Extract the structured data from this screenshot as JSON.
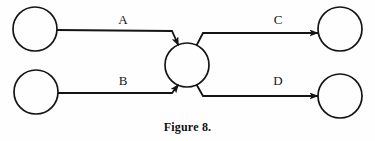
{
  "figure": {
    "caption": "Figure 8.",
    "background_color": "#fefefe",
    "stroke_color": "#141414"
  },
  "nodes": [
    {
      "id": "source-top",
      "name": "circle-node-source-top",
      "cx": 35,
      "cy": 29,
      "r": 22,
      "label": ""
    },
    {
      "id": "source-bottom",
      "name": "circle-node-source-bottom",
      "cx": 36,
      "cy": 92,
      "r": 22,
      "label": ""
    },
    {
      "id": "hub",
      "name": "circle-node-hub",
      "cx": 187,
      "cy": 65,
      "r": 22,
      "label": ""
    },
    {
      "id": "sink-top",
      "name": "circle-node-sink-top",
      "cx": 340,
      "cy": 29,
      "r": 22,
      "label": ""
    },
    {
      "id": "sink-bottom",
      "name": "circle-node-sink-bottom",
      "cx": 340,
      "cy": 96,
      "r": 22,
      "label": ""
    }
  ],
  "edges": [
    {
      "id": "edge-a",
      "label": "A",
      "from": "source-top",
      "to": "hub",
      "label_x": 111,
      "label_y": 13
    },
    {
      "id": "edge-b",
      "label": "B",
      "from": "source-bottom",
      "to": "hub",
      "label_x": 111,
      "label_y": 74
    },
    {
      "id": "edge-c",
      "label": "C",
      "from": "hub",
      "to": "sink-top",
      "label_x": 266,
      "label_y": 13
    },
    {
      "id": "edge-d",
      "label": "D",
      "from": "hub",
      "to": "sink-bottom",
      "label_x": 266,
      "label_y": 74
    }
  ]
}
